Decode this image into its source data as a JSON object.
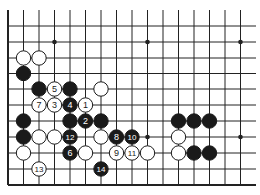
{
  "board": {
    "cols_x": [
      8,
      23.5,
      39,
      54.5,
      70,
      85.5,
      101,
      116.5,
      132,
      147.5,
      163,
      178.5,
      194,
      209.5,
      225,
      240.5
    ],
    "rows_y": [
      26,
      42,
      58,
      73.5,
      89,
      105,
      121,
      137,
      153,
      169,
      185
    ],
    "line_top": 10,
    "line_right": 256,
    "line_color": "#222222",
    "star_points": [
      [
        3,
        1
      ],
      [
        9,
        1
      ],
      [
        15,
        1
      ],
      [
        9,
        7
      ],
      [
        15,
        7
      ]
    ],
    "stone_radius": 7.2
  },
  "stones": [
    {
      "c": 1,
      "r": 2,
      "color": "white",
      "label": ""
    },
    {
      "c": 2,
      "r": 2,
      "color": "white",
      "label": ""
    },
    {
      "c": 1,
      "r": 3,
      "color": "black",
      "label": ""
    },
    {
      "c": 2,
      "r": 4,
      "color": "black",
      "label": ""
    },
    {
      "c": 3,
      "r": 4,
      "color": "white",
      "label": "5"
    },
    {
      "c": 4,
      "r": 4,
      "color": "black",
      "label": ""
    },
    {
      "c": 6,
      "r": 4,
      "color": "white",
      "label": ""
    },
    {
      "c": 2,
      "r": 5,
      "color": "white",
      "label": "7"
    },
    {
      "c": 3,
      "r": 5,
      "color": "white",
      "label": "3"
    },
    {
      "c": 4,
      "r": 5,
      "color": "black",
      "label": "4"
    },
    {
      "c": 5,
      "r": 5,
      "color": "white",
      "label": "1"
    },
    {
      "c": 1,
      "r": 6,
      "color": "black",
      "label": ""
    },
    {
      "c": 4,
      "r": 6,
      "color": "black",
      "label": ""
    },
    {
      "c": 5,
      "r": 6,
      "color": "black",
      "label": "2"
    },
    {
      "c": 6,
      "r": 6,
      "color": "black",
      "label": ""
    },
    {
      "c": 11,
      "r": 6,
      "color": "black",
      "label": ""
    },
    {
      "c": 12,
      "r": 6,
      "color": "black",
      "label": ""
    },
    {
      "c": 13,
      "r": 6,
      "color": "black",
      "label": ""
    },
    {
      "c": 1,
      "r": 7,
      "color": "black",
      "label": ""
    },
    {
      "c": 2,
      "r": 7,
      "color": "white",
      "label": ""
    },
    {
      "c": 3,
      "r": 7,
      "color": "white",
      "label": ""
    },
    {
      "c": 4,
      "r": 7,
      "color": "black",
      "label": "12"
    },
    {
      "c": 6,
      "r": 7,
      "color": "white",
      "label": ""
    },
    {
      "c": 7,
      "r": 7,
      "color": "black",
      "label": "8"
    },
    {
      "c": 8,
      "r": 7,
      "color": "black",
      "label": "10"
    },
    {
      "c": 11,
      "r": 7,
      "color": "white",
      "label": ""
    },
    {
      "c": 1,
      "r": 8,
      "color": "white",
      "label": ""
    },
    {
      "c": 4,
      "r": 8,
      "color": "black",
      "label": "6"
    },
    {
      "c": 5,
      "r": 8,
      "color": "white",
      "label": ""
    },
    {
      "c": 7,
      "r": 8,
      "color": "white",
      "label": "9"
    },
    {
      "c": 8,
      "r": 8,
      "color": "white",
      "label": "11"
    },
    {
      "c": 9,
      "r": 8,
      "color": "white",
      "label": ""
    },
    {
      "c": 11,
      "r": 8,
      "color": "white",
      "label": ""
    },
    {
      "c": 12,
      "r": 8,
      "color": "black",
      "label": ""
    },
    {
      "c": 13,
      "r": 8,
      "color": "black",
      "label": ""
    },
    {
      "c": 2,
      "r": 9,
      "color": "white",
      "label": "13"
    },
    {
      "c": 6,
      "r": 9,
      "color": "black",
      "label": "14"
    }
  ]
}
